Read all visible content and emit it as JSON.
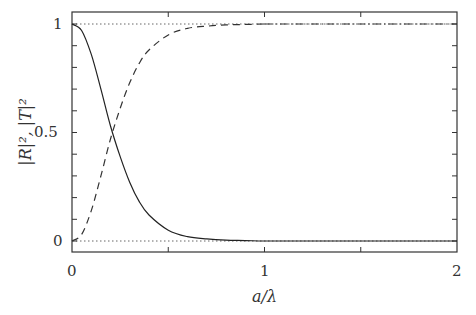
{
  "chart_data": {
    "type": "line",
    "title": "",
    "xlabel": "a/λ",
    "ylabel": "|R|², |T|²",
    "xlim": [
      0,
      2
    ],
    "ylim": [
      -0.05,
      1.05
    ],
    "grid": false,
    "legend": null,
    "x_ticks": [
      "0",
      "1",
      "2"
    ],
    "x_minor_ticks": [
      0.5,
      1.5
    ],
    "y_ticks": [
      "0",
      "0.5",
      "1"
    ],
    "y_minor_step": 0.1,
    "reference_lines": [
      {
        "y": 0,
        "style": "dotted"
      },
      {
        "y": 1,
        "style": "dotted"
      }
    ],
    "x": [
      0,
      0.05,
      0.1,
      0.15,
      0.2,
      0.25,
      0.3,
      0.35,
      0.4,
      0.5,
      0.6,
      0.7,
      0.8,
      0.9,
      1.0,
      1.2,
      1.5,
      2.0
    ],
    "series": [
      {
        "name": "|R|^2",
        "style": "solid",
        "values": [
          1.0,
          0.97,
          0.86,
          0.7,
          0.53,
          0.39,
          0.27,
          0.18,
          0.12,
          0.05,
          0.02,
          0.01,
          0.004,
          0.002,
          0.0,
          0.0,
          0.0,
          0.0
        ]
      },
      {
        "name": "|T|^2",
        "style": "dashed (dash-dot for a/λ > 1)",
        "values": [
          0.0,
          0.03,
          0.14,
          0.3,
          0.47,
          0.61,
          0.73,
          0.82,
          0.88,
          0.95,
          0.98,
          0.99,
          0.996,
          0.998,
          1.0,
          1.0,
          1.0,
          1.0
        ]
      }
    ]
  },
  "labels": {
    "x_tick_0": "0",
    "x_tick_1": "1",
    "x_tick_2": "2",
    "y_tick_0": "0",
    "y_tick_05": "0.5",
    "y_tick_1": "1",
    "xlabel": "a/λ",
    "ylabel": "|R|², |T|²"
  }
}
